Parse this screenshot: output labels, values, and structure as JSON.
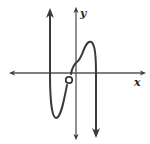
{
  "diagram": {
    "type": "function-graph",
    "axes": {
      "x_label": "x",
      "y_label": "y",
      "color": "#4a4a4a"
    },
    "curve": {
      "color": "#3a3a3a",
      "description": "Polynomial-like curve with end behavior: left end rises to +infinity, right end falls to -infinity; local minimum below x-axis left of y-axis, local maximum above x-axis right of y-axis; open circle (hole) just below x-axis near origin",
      "features": {
        "left_end": "up",
        "right_end": "down",
        "local_min": "left of y-axis, below x-axis",
        "local_max": "right of y-axis, above x-axis",
        "hole": "open circle near origin, slightly left of y-axis and below x-axis"
      }
    },
    "background": "#ffffff"
  }
}
